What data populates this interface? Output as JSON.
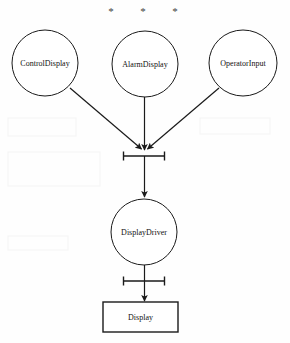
{
  "diagram": {
    "type": "uml-activity-flow",
    "background_color": "#fefefe",
    "stroke_color": "#1a1a1a",
    "text_color": "#111111",
    "asterisks": [
      {
        "name": "asterisk-left",
        "glyph": "*",
        "x": 111,
        "y": 12
      },
      {
        "name": "asterisk-middle",
        "glyph": "*",
        "x": 143,
        "y": 12
      },
      {
        "name": "asterisk-right",
        "glyph": "*",
        "x": 175,
        "y": 12
      }
    ],
    "nodes": [
      {
        "id": "control-display",
        "label": "ControlDisplay",
        "shape": "ellipse",
        "cx": 45,
        "cy": 63,
        "rx": 33,
        "ry": 33
      },
      {
        "id": "alarm-display",
        "label": "AlarmDisplay",
        "shape": "ellipse",
        "cx": 145,
        "cy": 64,
        "rx": 33,
        "ry": 33
      },
      {
        "id": "operator-input",
        "label": "OperatorInput",
        "shape": "ellipse",
        "cx": 243,
        "cy": 63,
        "rx": 34,
        "ry": 33
      },
      {
        "id": "display-driver",
        "label": "DisplayDriver",
        "shape": "ellipse",
        "cx": 144,
        "cy": 232,
        "rx": 33,
        "ry": 33
      },
      {
        "id": "display",
        "label": "Display",
        "shape": "rectangle",
        "x": 103,
        "y": 302,
        "width": 75,
        "height": 30
      }
    ],
    "bars": [
      {
        "id": "join-bar-upper",
        "x1": 123,
        "x2": 165,
        "y": 156,
        "tick_height": 9
      },
      {
        "id": "join-bar-lower",
        "x1": 123,
        "x2": 165,
        "y": 281,
        "tick_height": 9
      }
    ],
    "edges": [
      {
        "id": "edge-control-to-join",
        "from": "control-display",
        "to": "join-bar-upper",
        "style": "diagonal",
        "arrow": true
      },
      {
        "id": "edge-alarm-to-join",
        "from": "alarm-display",
        "to": "join-bar-upper",
        "style": "vertical",
        "arrow": true
      },
      {
        "id": "edge-operator-to-join",
        "from": "operator-input",
        "to": "join-bar-upper",
        "style": "diagonal",
        "arrow": true
      },
      {
        "id": "edge-join-to-driver",
        "from": "join-bar-upper",
        "to": "display-driver",
        "style": "vertical",
        "arrow": true
      },
      {
        "id": "edge-driver-to-bar",
        "from": "display-driver",
        "to": "join-bar-lower",
        "style": "vertical",
        "arrow": false
      },
      {
        "id": "edge-bar-to-display",
        "from": "join-bar-lower",
        "to": "display",
        "style": "vertical",
        "arrow": true
      }
    ]
  }
}
